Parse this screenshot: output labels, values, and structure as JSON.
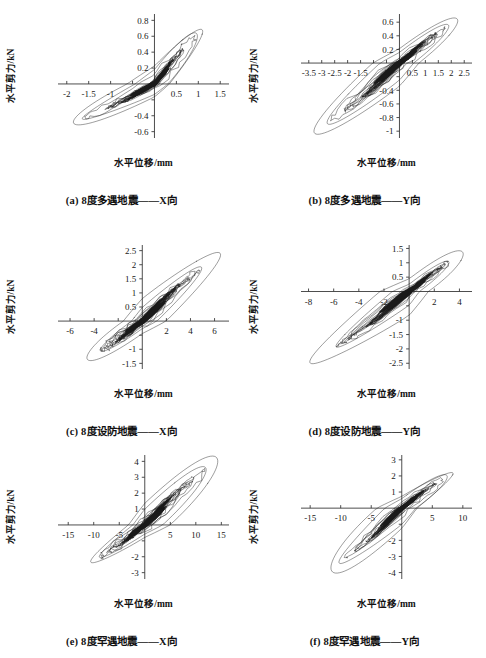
{
  "figure": {
    "axis_label_y": "水平剪力/kN",
    "axis_label_x": "水平位移/mm",
    "line_color": "#1a1a1a",
    "axis_color": "#3a3a3a",
    "background": "#ffffff"
  },
  "panels": [
    {
      "id": "a",
      "caption": "(a) 8度多遇地震——X向",
      "xlabel": "水平位移/mm",
      "ylabel": "水平剪力/kN",
      "xticks": [
        -2,
        -1.5,
        -1,
        -0.5,
        0,
        0.5,
        1,
        1.5
      ],
      "xticklabels": [
        "-2",
        "-1.5",
        "-1",
        "",
        "",
        "0.5",
        "1",
        "1.5"
      ],
      "yticks": [
        -0.6,
        -0.4,
        -0.2,
        0,
        0.2,
        0.4,
        0.6,
        0.8
      ],
      "yticklabels": [
        "-0.6",
        "-0.4",
        "",
        "",
        "0.2",
        "0.4",
        "0.6",
        "0.8"
      ],
      "xlim": [
        -2.2,
        1.7
      ],
      "ylim": [
        -0.68,
        0.88
      ],
      "peak_x": 1.1,
      "peak_y": 0.66,
      "neg_peak_x": -1.85,
      "neg_peak_y": -0.48,
      "n_loops": 26,
      "seed": 11
    },
    {
      "id": "b",
      "caption": "(b) 8度多遇地震——Y向",
      "xlabel": "水平位移/mm",
      "ylabel": "水平剪力/kN",
      "xticks": [
        -3.5,
        -3,
        -2.5,
        -2,
        -1.5,
        -1,
        -0.5,
        0,
        0.5,
        1,
        1.5,
        2,
        2.5
      ],
      "xticklabels": [
        "-3.5",
        "-3",
        "-2.5",
        "-2",
        "-1.5",
        "",
        "",
        "",
        "0.5",
        "1",
        "1.5",
        "2",
        "2.5"
      ],
      "yticks": [
        -1,
        -0.8,
        -0.6,
        -0.4,
        -0.2,
        0,
        0.2,
        0.4,
        0.6
      ],
      "yticklabels": [
        "-1",
        "-0.8",
        "-0.6",
        "-0.4",
        "",
        "",
        "0.2",
        "0.4",
        "0.6"
      ],
      "xlim": [
        -3.8,
        2.8
      ],
      "ylim": [
        -1.1,
        0.72
      ],
      "peak_x": 2.25,
      "peak_y": 0.62,
      "neg_peak_x": -3.3,
      "neg_peak_y": -1.0,
      "n_loops": 26,
      "seed": 23
    },
    {
      "id": "c",
      "caption": "(c) 8度设防地震——X向",
      "xlabel": "水平位移/mm",
      "ylabel": "水平剪力/kN",
      "xticks": [
        -6,
        -4,
        -2,
        0,
        2,
        4,
        6
      ],
      "xticklabels": [
        "-6",
        "-4",
        "",
        "",
        "2",
        "4",
        "6"
      ],
      "yticks": [
        -1.5,
        -1,
        -0.5,
        0,
        0.5,
        1,
        1.5,
        2,
        2.5
      ],
      "yticklabels": [
        "-1.5",
        "-1",
        "",
        "",
        "0.5",
        "1",
        "1.5",
        "2",
        "2.5"
      ],
      "xlim": [
        -7,
        7.2
      ],
      "ylim": [
        -1.7,
        2.7
      ],
      "peak_x": 6.5,
      "peak_y": 2.35,
      "neg_peak_x": -4.6,
      "neg_peak_y": -1.3,
      "n_loops": 30,
      "seed": 37
    },
    {
      "id": "d",
      "caption": "(d) 8度设防地震——Y向",
      "xlabel": "水平位移/mm",
      "ylabel": "水平剪力/kN",
      "xticks": [
        -8,
        -6,
        -4,
        -2,
        0,
        2,
        4
      ],
      "xticklabels": [
        "-8",
        "-6",
        "-4",
        "-2",
        "",
        "2",
        "4"
      ],
      "yticks": [
        -2.5,
        -2,
        -1.5,
        -1,
        -0.5,
        0,
        0.5,
        1,
        1.5
      ],
      "yticklabels": [
        "-2.5",
        "-2",
        "-1.5",
        "-1",
        "",
        "",
        "0.5",
        "1",
        "1.5"
      ],
      "xlim": [
        -8.6,
        5.0
      ],
      "ylim": [
        -2.7,
        1.62
      ],
      "peak_x": 4.3,
      "peak_y": 1.3,
      "neg_peak_x": -7.9,
      "neg_peak_y": -2.45,
      "n_loops": 30,
      "seed": 53
    },
    {
      "id": "e",
      "caption": "(e) 8度罕遇地震——X向",
      "xlabel": "水平位移/mm",
      "ylabel": "水平剪力/kN",
      "xticks": [
        -15,
        -10,
        -5,
        0,
        5,
        10,
        15
      ],
      "xticklabels": [
        "-15",
        "-10",
        "-5",
        "",
        "5",
        "10",
        "15"
      ],
      "yticks": [
        -3,
        -2,
        -1,
        0,
        1,
        2,
        3,
        4
      ],
      "yticklabels": [
        "-3",
        "-2",
        "",
        "",
        "1",
        "2",
        "3",
        "4"
      ],
      "xlim": [
        -17,
        16.5
      ],
      "ylim": [
        -3.4,
        4.4
      ],
      "peak_x": 14.3,
      "peak_y": 4.0,
      "neg_peak_x": -10.6,
      "neg_peak_y": -2.3,
      "n_loops": 34,
      "seed": 71
    },
    {
      "id": "f",
      "caption": "(f) 8度罕遇地震——Y向",
      "xlabel": "水平位移/mm",
      "ylabel": "水平剪力/kN",
      "xticks": [
        -15,
        -10,
        -5,
        0,
        5,
        10
      ],
      "xticklabels": [
        "-15",
        "-10",
        "-5",
        "",
        "5",
        "10"
      ],
      "yticks": [
        -4,
        -3,
        -2,
        -1,
        0,
        1,
        2,
        3
      ],
      "yticklabels": [
        "-4",
        "-3",
        "-2",
        "",
        "",
        "1",
        "2",
        "3"
      ],
      "xlim": [
        -16.5,
        11.5
      ],
      "ylim": [
        -4.4,
        3.3
      ],
      "peak_x": 8.4,
      "peak_y": 2.15,
      "neg_peak_x": -11.6,
      "neg_peak_y": -3.7,
      "n_loops": 34,
      "seed": 97
    }
  ],
  "chart_data": {
    "type": "line",
    "title": "",
    "subplots": [
      {
        "id": "a",
        "label": "(a) 8度多遇地震——X向",
        "xlabel": "水平位移/mm",
        "ylabel": "水平剪力/kN",
        "xlim": [
          -2.2,
          1.7
        ],
        "ylim": [
          -0.68,
          0.88
        ],
        "xticks": [
          -2,
          -1.5,
          -1,
          -0.5,
          0,
          0.5,
          1,
          1.5
        ],
        "yticks": [
          -0.6,
          -0.4,
          -0.2,
          0,
          0.2,
          0.4,
          0.6,
          0.8
        ],
        "grid": false,
        "legend": "none",
        "description": "Hysteretic (force-displacement) loops, dense cluster near origin, skeleton slope ~0.6 kN/mm",
        "max_displacement_mm": 1.1,
        "min_displacement_mm": -1.85,
        "max_shear_kN": 0.66,
        "min_shear_kN": -0.48
      },
      {
        "id": "b",
        "label": "(b) 8度多遇地震——Y向",
        "xlabel": "水平位移/mm",
        "ylabel": "水平剪力/kN",
        "xlim": [
          -3.8,
          2.8
        ],
        "ylim": [
          -1.1,
          0.72
        ],
        "xticks": [
          -3.5,
          -3,
          -2.5,
          -2,
          -1.5,
          -1,
          -0.5,
          0,
          0.5,
          1,
          1.5,
          2,
          2.5
        ],
        "yticks": [
          -1,
          -0.8,
          -0.6,
          -0.4,
          -0.2,
          0,
          0.2,
          0.4,
          0.6
        ],
        "grid": false,
        "legend": "none",
        "description": "Hysteretic loops, narrow pinched shape, skeleton slope ~0.3 kN/mm",
        "max_displacement_mm": 2.25,
        "min_displacement_mm": -3.3,
        "max_shear_kN": 0.62,
        "min_shear_kN": -1.0
      },
      {
        "id": "c",
        "label": "(c) 8度设防地震——X向",
        "xlabel": "水平位移/mm",
        "ylabel": "水平剪力/kN",
        "xlim": [
          -7,
          7.2
        ],
        "ylim": [
          -1.7,
          2.7
        ],
        "xticks": [
          -6,
          -4,
          -2,
          0,
          2,
          4,
          6
        ],
        "yticks": [
          -1.5,
          -1,
          -0.5,
          0,
          0.5,
          1,
          1.5,
          2,
          2.5
        ],
        "grid": false,
        "legend": "none",
        "description": "Hysteretic loops with one large outer excursion loop reaching 6.5 mm / 2.35 kN",
        "max_displacement_mm": 6.5,
        "min_displacement_mm": -4.6,
        "max_shear_kN": 2.35,
        "min_shear_kN": -1.3
      },
      {
        "id": "d",
        "label": "(d) 8度设防地震——Y向",
        "xlabel": "水平位移/mm",
        "ylabel": "水平剪力/kN",
        "xlim": [
          -8.6,
          5.0
        ],
        "ylim": [
          -2.7,
          1.62
        ],
        "xticks": [
          -8,
          -6,
          -4,
          -2,
          0,
          2,
          4
        ],
        "yticks": [
          -2.5,
          -2,
          -1.5,
          -1,
          -0.5,
          0,
          0.5,
          1,
          1.5
        ],
        "grid": false,
        "legend": "none",
        "description": "Hysteretic loops extending to -7.9 mm / -2.45 kN in the third quadrant",
        "max_displacement_mm": 4.3,
        "min_displacement_mm": -7.9,
        "max_shear_kN": 1.3,
        "min_shear_kN": -2.45
      },
      {
        "id": "e",
        "label": "(e) 8度罕遇地震——X向",
        "xlabel": "水平位移/mm",
        "ylabel": "水平剪力/kN",
        "xlim": [
          -17,
          16.5
        ],
        "ylim": [
          -3.4,
          4.4
        ],
        "xticks": [
          -15,
          -10,
          -5,
          0,
          5,
          10,
          15
        ],
        "yticks": [
          -3,
          -2,
          -1,
          0,
          1,
          2,
          3,
          4
        ],
        "grid": false,
        "legend": "none",
        "description": "Hysteretic loops with broad outer loop from -10.6 mm to 14.3 mm",
        "max_displacement_mm": 14.3,
        "min_displacement_mm": -10.6,
        "max_shear_kN": 4.0,
        "min_shear_kN": -2.3
      },
      {
        "id": "f",
        "label": "(f) 8度罕遇地震——Y向",
        "xlabel": "水平位移/mm",
        "ylabel": "水平剪力/kN",
        "xlim": [
          -16.5,
          11.5
        ],
        "ylim": [
          -4.4,
          3.3
        ],
        "xticks": [
          -15,
          -10,
          -5,
          0,
          5,
          10
        ],
        "yticks": [
          -4,
          -3,
          -2,
          -1,
          0,
          1,
          2,
          3
        ],
        "grid": false,
        "legend": "none",
        "description": "Hysteretic loops, slender pinched form reaching -11.6 mm / -3.7 kN",
        "max_displacement_mm": 8.4,
        "min_displacement_mm": -11.6,
        "max_shear_kN": 2.15,
        "min_shear_kN": -3.7
      }
    ]
  }
}
